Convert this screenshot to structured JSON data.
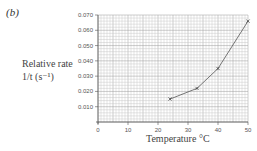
{
  "panel_label": "(b)",
  "chart_data": {
    "type": "line",
    "title": "",
    "xlabel": "Temperature °C",
    "ylabel": "Relative rate 1/t (s⁻¹)",
    "ylabel_lines": [
      "Relative rate",
      "1/t (s⁻¹)"
    ],
    "xlim": [
      0,
      50
    ],
    "ylim": [
      0,
      0.07
    ],
    "xticks": [
      "0",
      "10",
      "20",
      "30",
      "40",
      "50"
    ],
    "yticks": [
      "0.010",
      "0.020",
      "0.030",
      "0.040",
      "0.050",
      "0.060",
      "0.070"
    ],
    "grid": true,
    "legend": null,
    "series": [
      {
        "name": "Relative rate",
        "x": [
          24,
          33,
          40,
          50
        ],
        "y": [
          0.015,
          0.022,
          0.035,
          0.066
        ],
        "marker": "x"
      }
    ]
  }
}
